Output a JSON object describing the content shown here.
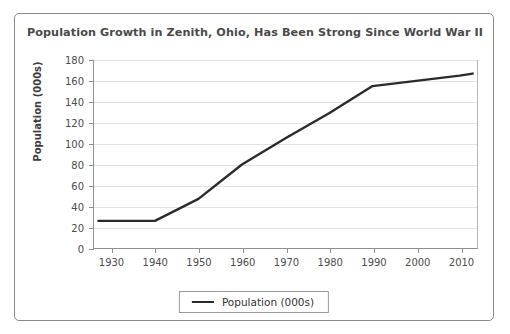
{
  "chart_data": {
    "type": "line",
    "title": "Population Growth in Zenith, Ohio, Has Been Strong Since World War II",
    "xlabel": "",
    "ylabel": "Population (000s)",
    "xlim": [
      1926,
      2014
    ],
    "ylim": [
      0,
      180
    ],
    "grid": true,
    "legend_position": "bottom",
    "y_ticks": [
      0,
      20,
      40,
      60,
      80,
      100,
      120,
      140,
      160,
      180
    ],
    "x_ticks": [
      1930,
      1940,
      1950,
      1960,
      1970,
      1980,
      1990,
      2000,
      2010
    ],
    "series": [
      {
        "name": "Population (000s)",
        "color": "#2b2b2b",
        "x": [
          1927,
          1940,
          1950,
          1960,
          1970,
          1980,
          1990,
          2000,
          2010,
          2013
        ],
        "values": [
          26,
          26,
          47,
          80,
          105,
          129,
          155,
          160,
          165,
          167
        ]
      }
    ]
  },
  "legend": {
    "items": [
      {
        "label": "Population (000s)",
        "swatch": "line-swatch"
      }
    ]
  },
  "axis": {
    "y_tick_labels": [
      "0",
      "20",
      "40",
      "60",
      "80",
      "100",
      "120",
      "140",
      "160",
      "180"
    ],
    "x_tick_labels": [
      "1930",
      "1940",
      "1950",
      "1960",
      "1970",
      "1980",
      "1990",
      "2000",
      "2010"
    ]
  }
}
